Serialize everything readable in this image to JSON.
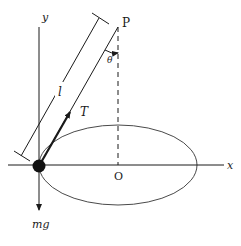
{
  "diagram": {
    "type": "conical-pendulum",
    "labels": {
      "y_axis": "y",
      "x_axis": "x",
      "pivot": "P",
      "origin": "O",
      "length": "l",
      "angle": "θ",
      "tension": "T",
      "weight": "mg"
    },
    "colors": {
      "line": "#1a1a1a",
      "ellipse": "#4a4a4a",
      "background": "#ffffff"
    }
  }
}
